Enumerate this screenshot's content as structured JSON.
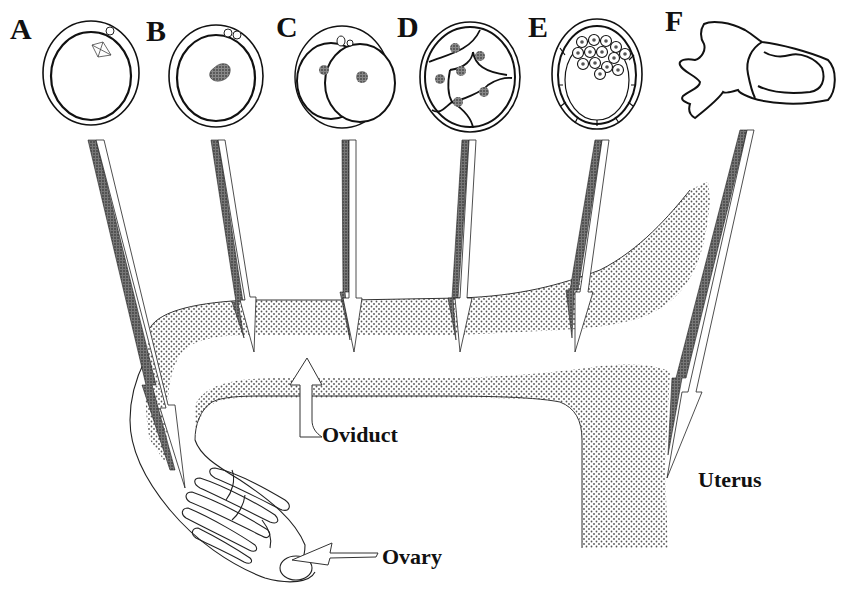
{
  "figure": {
    "stages": [
      {
        "id": "A",
        "label": "A",
        "depicts": "oocyte with meiotic spindle and polar body"
      },
      {
        "id": "B",
        "label": "B",
        "depicts": "fertilized zygote with pronucleus and two polar bodies"
      },
      {
        "id": "C",
        "label": "C",
        "depicts": "2-cell embryo"
      },
      {
        "id": "D",
        "label": "D",
        "depicts": "multi-cell cleavage-stage embryo"
      },
      {
        "id": "E",
        "label": "E",
        "depicts": "blastocyst with inner cell mass"
      },
      {
        "id": "F",
        "label": "F",
        "depicts": "implanting post-hatching embryo"
      }
    ],
    "anatomy_labels": {
      "oviduct": "Oviduct",
      "ovary": "Ovary",
      "uterus": "Uterus"
    },
    "colors": {
      "ink": "#111111",
      "stipple": "#6b6b6b",
      "arrow_shadow": "#555555",
      "background": "#ffffff"
    }
  }
}
